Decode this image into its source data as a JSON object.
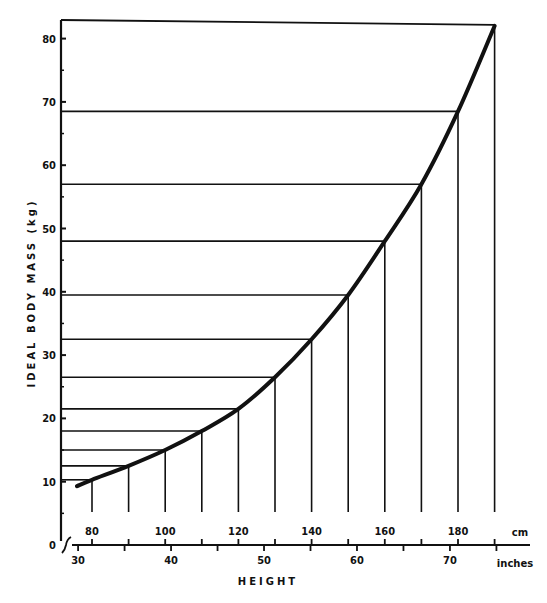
{
  "chart_data": {
    "type": "line",
    "title": "",
    "xlabel": "HEIGHT",
    "ylabel": "IDEAL BODY MASS (kg)",
    "x_primary_unit": "cm",
    "x_secondary_unit": "inches",
    "x": [
      80,
      90,
      100,
      110,
      120,
      130,
      140,
      150,
      160,
      170,
      180,
      190
    ],
    "values": [
      10.3,
      12.5,
      15.0,
      18.0,
      21.5,
      26.5,
      32.5,
      39.5,
      48.0,
      57.0,
      68.5,
      82.0
    ],
    "series": [
      {
        "name": "Ideal body mass",
        "x": [
          80,
          90,
          100,
          110,
          120,
          130,
          140,
          150,
          160,
          170,
          180,
          190
        ],
        "values": [
          10.3,
          12.5,
          15.0,
          18.0,
          21.5,
          26.5,
          32.5,
          39.5,
          48.0,
          57.0,
          68.5,
          82.0
        ]
      }
    ],
    "x_ticks_cm": [
      "80",
      "100",
      "120",
      "140",
      "160",
      "180"
    ],
    "x_ticks_inches": [
      "30",
      "40",
      "50",
      "60",
      "70"
    ],
    "y_ticks": [
      "0",
      "10",
      "20",
      "30",
      "40",
      "50",
      "60",
      "70",
      "80"
    ],
    "ylim": [
      0,
      83
    ],
    "xlim_cm": [
      76,
      192
    ],
    "grid": false,
    "drop_lines": true,
    "legend": null
  },
  "labels": {
    "y_axis_title": "IDEAL BODY MASS (kg)",
    "x_axis_title": "HEIGHT",
    "cm_unit": "cm",
    "inches_unit": "inches"
  }
}
